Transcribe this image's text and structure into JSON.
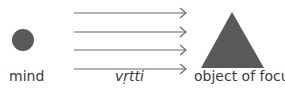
{
  "diagram": {
    "labels": {
      "mind": "mind",
      "vrtti": "vṛtti",
      "object": "object of focus"
    },
    "colors": {
      "shape_fill": "#5a5a5a",
      "arrow": "#6a6a6a",
      "text": "#3a3a3a"
    },
    "arrows_count": 4
  }
}
